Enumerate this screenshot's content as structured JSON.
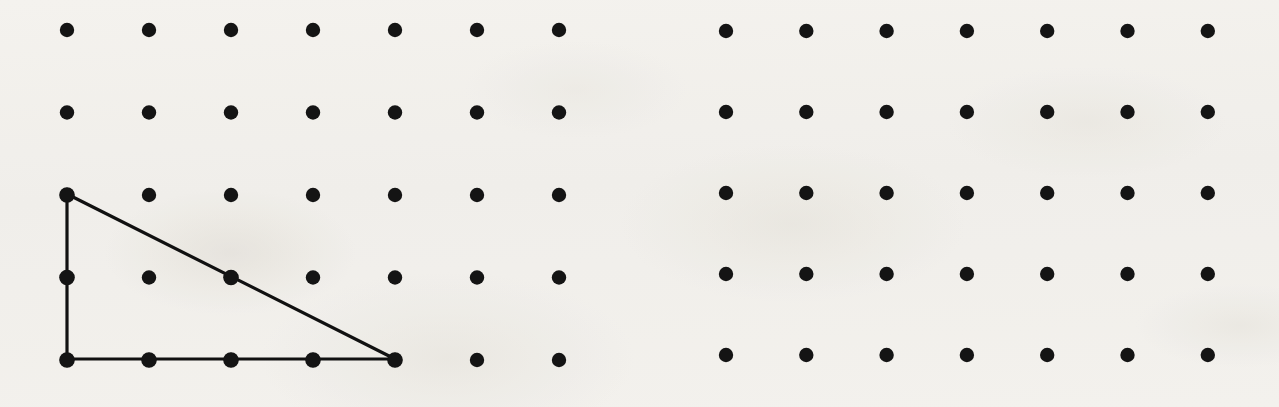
{
  "figure": {
    "background_color": "#f9f8f6",
    "ink_color": "#141414",
    "canvas": {
      "width": 1279,
      "height": 407
    }
  },
  "dot_grid_left": {
    "label": "left dot array",
    "columns": 7,
    "rows": 5,
    "origin_x": 67,
    "origin_y": 30,
    "spacing_x": 82,
    "spacing_y": 82.5,
    "dot_radius": 7.2
  },
  "dot_grid_right": {
    "label": "right dot array",
    "columns": 7,
    "rows": 5,
    "origin_x": 726,
    "origin_y": 31,
    "spacing_x": 80.3,
    "spacing_y": 81,
    "dot_radius": 7.2
  },
  "triangle": {
    "label": "right triangle on left grid",
    "stroke_color": "#111111",
    "stroke_width": 3.2,
    "vertices_grid": [
      {
        "name": "top-left",
        "col": 0,
        "row": 2
      },
      {
        "name": "bottom-left",
        "col": 0,
        "row": 4
      },
      {
        "name": "bottom-right",
        "col": 4,
        "row": 4
      }
    ],
    "vertices_px": [
      {
        "name": "top-left",
        "x": 67,
        "y": 194
      },
      {
        "name": "bottom-left",
        "x": 67,
        "y": 359
      },
      {
        "name": "bottom-right",
        "x": 395,
        "y": 359
      }
    ],
    "edges": [
      {
        "name": "vertical-leg",
        "from": "top-left",
        "to": "bottom-left"
      },
      {
        "name": "horizontal-leg",
        "from": "bottom-left",
        "to": "bottom-right"
      },
      {
        "name": "hypotenuse",
        "from": "bottom-right",
        "to": "top-left"
      }
    ],
    "dots_on_hypotenuse": [
      {
        "col": 2,
        "row": 3
      }
    ]
  }
}
